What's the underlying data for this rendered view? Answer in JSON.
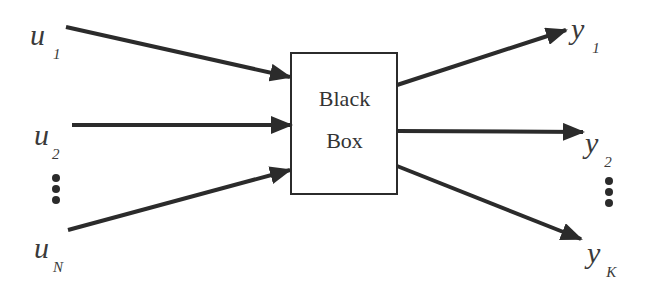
{
  "diagram": {
    "box": {
      "line1": "Black",
      "line2": "Box"
    },
    "inputs": [
      {
        "var": "u",
        "sub": "1"
      },
      {
        "var": "u",
        "sub": "2"
      },
      {
        "var": "u",
        "sub": "N"
      }
    ],
    "outputs": [
      {
        "var": "y",
        "sub": "1"
      },
      {
        "var": "y",
        "sub": "2"
      },
      {
        "var": "y",
        "sub": "K"
      }
    ],
    "ellipsis_left": "vertical-dots",
    "ellipsis_right": "vertical-dots",
    "colors": {
      "stroke": "#2b2b2b",
      "text": "#3a3a3a",
      "background": "#ffffff"
    }
  }
}
